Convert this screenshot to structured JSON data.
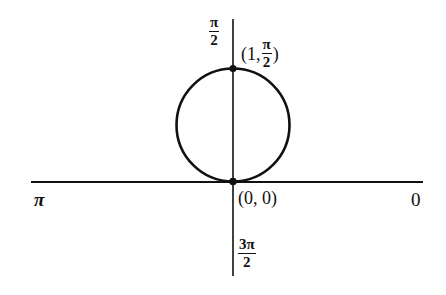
{
  "diagram": {
    "type": "polar-circle",
    "colors": {
      "stroke": "#111111",
      "background": "#ffffff"
    },
    "axis_labels": {
      "right": "0",
      "left": "π",
      "top": {
        "num": "π",
        "den": "2"
      },
      "bottom": {
        "num": "3π",
        "den": "2"
      }
    },
    "points": [
      {
        "name": "top-point",
        "open": "(1,",
        "frac_num": "π",
        "frac_den": "2",
        "close": ")"
      },
      {
        "name": "origin-point",
        "text": "(0, 0)"
      }
    ]
  }
}
